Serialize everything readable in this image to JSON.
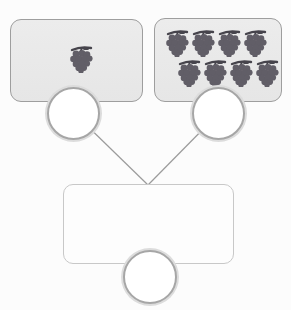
{
  "diagram": {
    "type": "number-bond-part-part-whole",
    "item": "grapes",
    "parts": [
      {
        "id": "left",
        "item": "grapes",
        "count": 1,
        "answer": ""
      },
      {
        "id": "right",
        "item": "grapes",
        "count": 8,
        "answer": ""
      }
    ],
    "total": {
      "answer": ""
    },
    "colors": {
      "box_fill": "#e9e9e9",
      "box_border": "#9e9e9e",
      "total_box_border": "#c8c8c8",
      "circle_border": "#a6a6a6",
      "circle_halo": "#dcdcdc",
      "line": "#9b9b9b",
      "grape_body": "#615e67",
      "grape_stem": "#46444c",
      "page_bg": "#fcfcfc"
    }
  }
}
